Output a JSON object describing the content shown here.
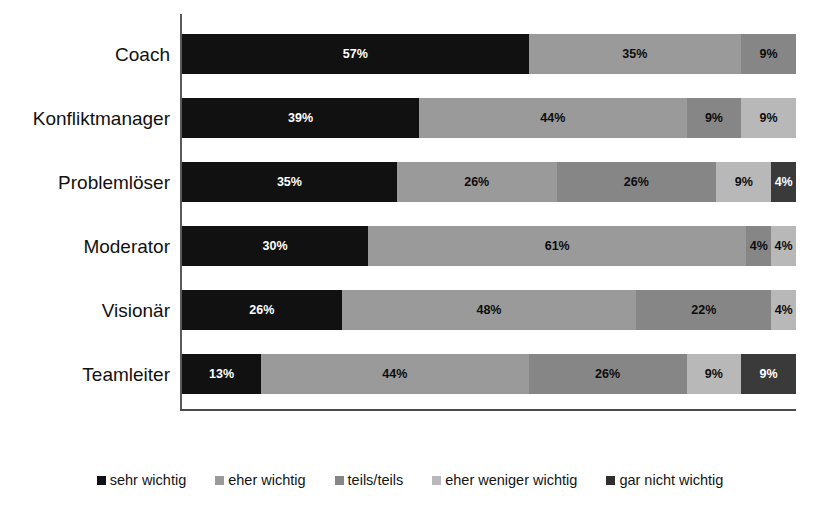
{
  "chart_data": {
    "type": "bar",
    "orientation": "horizontal",
    "stacked": true,
    "normalized_percent": true,
    "title": "",
    "subtitle": "",
    "xlabel": "",
    "ylabel": "",
    "xlim": [
      0,
      100
    ],
    "grid": false,
    "legend_position": "bottom",
    "categories": [
      "Coach",
      "Konfliktmanager",
      "Problemlöser",
      "Moderator",
      "Visionär",
      "Teamleiter"
    ],
    "series": [
      {
        "name": "sehr wichtig",
        "color": "#111111",
        "values": [
          57,
          39,
          35,
          30,
          26,
          13
        ]
      },
      {
        "name": "eher wichtig",
        "color": "#9a9a9a",
        "values": [
          35,
          44,
          26,
          61,
          48,
          44
        ]
      },
      {
        "name": "teils/teils",
        "color": "#868686",
        "values": [
          9,
          9,
          26,
          4,
          22,
          26
        ]
      },
      {
        "name": "eher weniger wichtig",
        "color": "#b8b8b8",
        "values": [
          0,
          9,
          9,
          4,
          4,
          9
        ]
      },
      {
        "name": "gar nicht wichtig",
        "color": "#3a3a3a",
        "values": [
          0,
          0,
          4,
          0,
          0,
          9
        ]
      }
    ],
    "rows": [
      {
        "category": "Coach",
        "segments": [
          {
            "series": "sehr wichtig",
            "value": 57,
            "label": "57%",
            "color": "#111111",
            "text_on": "dark"
          },
          {
            "series": "eher wichtig",
            "value": 35,
            "label": "35%",
            "color": "#9a9a9a",
            "text_on": "light"
          },
          {
            "series": "teils/teils",
            "value": 9,
            "label": "9%",
            "color": "#868686",
            "text_on": "light"
          }
        ]
      },
      {
        "category": "Konfliktmanager",
        "segments": [
          {
            "series": "sehr wichtig",
            "value": 39,
            "label": "39%",
            "color": "#111111",
            "text_on": "dark"
          },
          {
            "series": "eher wichtig",
            "value": 44,
            "label": "44%",
            "color": "#9a9a9a",
            "text_on": "light"
          },
          {
            "series": "teils/teils",
            "value": 9,
            "label": "9%",
            "color": "#868686",
            "text_on": "light"
          },
          {
            "series": "eher weniger wichtig",
            "value": 9,
            "label": "9%",
            "color": "#b8b8b8",
            "text_on": "light"
          }
        ]
      },
      {
        "category": "Problemlöser",
        "segments": [
          {
            "series": "sehr wichtig",
            "value": 35,
            "label": "35%",
            "color": "#111111",
            "text_on": "dark"
          },
          {
            "series": "eher wichtig",
            "value": 26,
            "label": "26%",
            "color": "#9a9a9a",
            "text_on": "light"
          },
          {
            "series": "teils/teils",
            "value": 26,
            "label": "26%",
            "color": "#868686",
            "text_on": "light"
          },
          {
            "series": "eher weniger wichtig",
            "value": 9,
            "label": "9%",
            "color": "#b8b8b8",
            "text_on": "light"
          },
          {
            "series": "gar nicht wichtig",
            "value": 4,
            "label": "4%",
            "color": "#3a3a3a",
            "text_on": "dark"
          }
        ]
      },
      {
        "category": "Moderator",
        "segments": [
          {
            "series": "sehr wichtig",
            "value": 30,
            "label": "30%",
            "color": "#111111",
            "text_on": "dark"
          },
          {
            "series": "eher wichtig",
            "value": 61,
            "label": "61%",
            "color": "#9a9a9a",
            "text_on": "light"
          },
          {
            "series": "teils/teils",
            "value": 4,
            "label": "4%",
            "color": "#868686",
            "text_on": "light"
          },
          {
            "series": "eher weniger wichtig",
            "value": 4,
            "label": "4%",
            "color": "#b8b8b8",
            "text_on": "light"
          }
        ]
      },
      {
        "category": "Visionär",
        "segments": [
          {
            "series": "sehr wichtig",
            "value": 26,
            "label": "26%",
            "color": "#111111",
            "text_on": "dark"
          },
          {
            "series": "eher wichtig",
            "value": 48,
            "label": "48%",
            "color": "#9a9a9a",
            "text_on": "light"
          },
          {
            "series": "teils/teils",
            "value": 22,
            "label": "22%",
            "color": "#868686",
            "text_on": "light"
          },
          {
            "series": "eher weniger wichtig",
            "value": 4,
            "label": "4%",
            "color": "#b8b8b8",
            "text_on": "light"
          }
        ]
      },
      {
        "category": "Teamleiter",
        "segments": [
          {
            "series": "sehr wichtig",
            "value": 13,
            "label": "13%",
            "color": "#111111",
            "text_on": "dark"
          },
          {
            "series": "eher wichtig",
            "value": 44,
            "label": "44%",
            "color": "#9a9a9a",
            "text_on": "light"
          },
          {
            "series": "teils/teils",
            "value": 26,
            "label": "26%",
            "color": "#868686",
            "text_on": "light"
          },
          {
            "series": "eher weniger wichtig",
            "value": 9,
            "label": "9%",
            "color": "#b8b8b8",
            "text_on": "light"
          },
          {
            "series": "gar nicht wichtig",
            "value": 9,
            "label": "9%",
            "color": "#3a3a3a",
            "text_on": "dark"
          }
        ]
      }
    ],
    "legend": [
      {
        "label": "sehr wichtig",
        "color": "#111111"
      },
      {
        "label": "eher wichtig",
        "color": "#9a9a9a"
      },
      {
        "label": "teils/teils",
        "color": "#868686"
      },
      {
        "label": "eher weniger wichtig",
        "color": "#b8b8b8"
      },
      {
        "label": "gar nicht wichtig",
        "color": "#2f2f2f"
      }
    ]
  },
  "axes": {
    "axis_color": "#4a4a4a"
  }
}
